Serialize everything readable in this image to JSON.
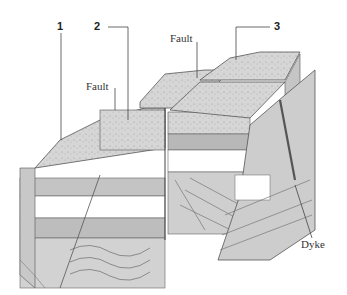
{
  "diagram": {
    "labels": {
      "marker_1": "1",
      "marker_2": "2",
      "marker_3": "3",
      "fault_left": "Fault",
      "fault_top": "Fault",
      "dyke": "Dyke"
    },
    "colors": {
      "background": "#ffffff",
      "line": "#555555",
      "rock_light": "#d9d9d9",
      "rock_mid": "#bdbdbd",
      "rock_dark": "#9a9a9a",
      "white_band": "#ffffff"
    }
  }
}
